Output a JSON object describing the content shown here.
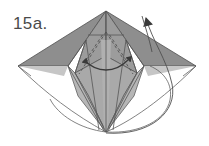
{
  "figure": {
    "step_label": "15a.",
    "caption": "",
    "type": "origami-fold-diagram",
    "background_color": "#ffffff"
  },
  "colors": {
    "paper_dark": "#8e8e8e",
    "paper_mid": "#a3a3a3",
    "paper_light": "#b6b6b6",
    "paper_lighter": "#c2c2c2",
    "outline": "#4f4f4f",
    "crease_solid": "#565656",
    "crease_dashed": "#5a5a5a",
    "arrow": "#3a3a3a",
    "label_text": "#4a4a4a"
  },
  "geometry": {
    "top_apex": [
      106,
      11
    ],
    "left_tip": [
      18,
      66
    ],
    "right_tip": [
      196,
      66
    ],
    "bottom_point": [
      106,
      132
    ],
    "left_shoulder": [
      68,
      66
    ],
    "right_shoulder": [
      144,
      66
    ],
    "inner_left": [
      86,
      40
    ],
    "inner_right": [
      126,
      40
    ],
    "horizontal_crease_y": 35
  },
  "annotations": {
    "arrows": [
      {
        "name": "spread-arrow-left",
        "direction": "left",
        "tip": [
          79,
          60
        ],
        "tail": [
          106,
          69
        ],
        "style": "curved-double-spread"
      },
      {
        "name": "spread-arrow-right",
        "direction": "right",
        "tip": [
          133,
          60
        ],
        "tail": [
          106,
          69
        ],
        "style": "curved-double-spread"
      },
      {
        "name": "fold-up-arrow",
        "direction": "up-right",
        "tip": [
          143,
          8
        ],
        "tail": [
          106,
          132
        ],
        "style": "large-curved-valley"
      }
    ],
    "dashed_creases": 4,
    "solid_creases": 9,
    "ghost_outlines": 2
  }
}
